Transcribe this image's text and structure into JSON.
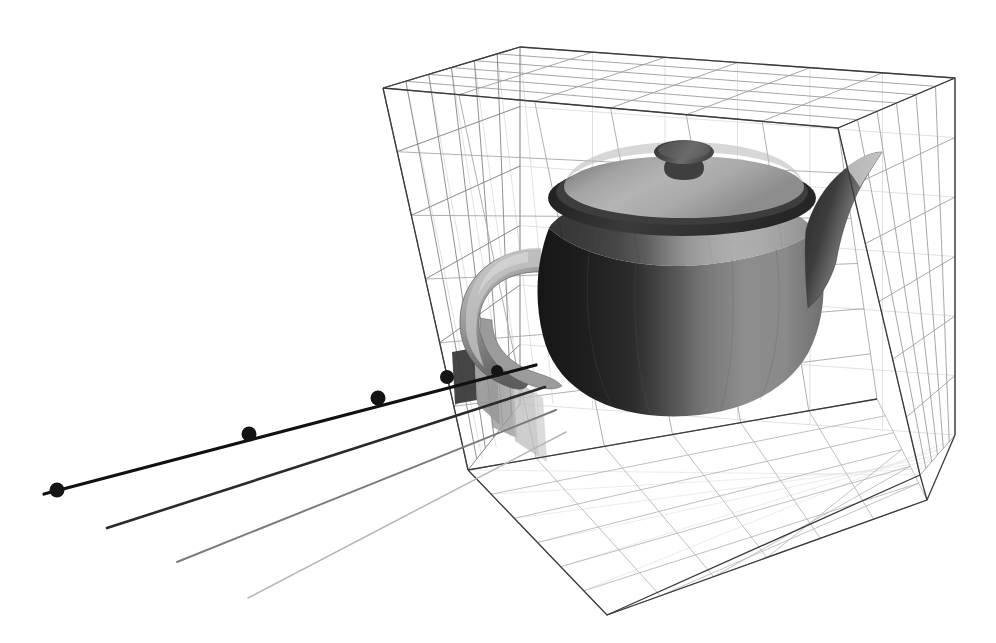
{
  "figure": {
    "title": "Ray traversal through a uniform voxel grid containing a Utah teapot",
    "caption": "",
    "background_color": "#ffffff",
    "width": 996,
    "height": 643
  },
  "palette": {
    "wire_edge": "#3a3a3a",
    "wire_grid_front": "#8e8e8e",
    "wire_grid_back": "#c8c8c8",
    "wire_grid_faint": "#dcdcdc",
    "ray_primary": "#111111",
    "ray_secondary": "#3d3d3d",
    "ray_tertiary": "#8a8a8a",
    "ray_quaternary": "#bdbdbd",
    "sample_dot": "#141414",
    "voxel_hit_dark": "#3b3b3b",
    "voxel_hit_mid": "#8f8f8f",
    "voxel_hit_light": "#b9b9b9",
    "teapot_dark": "#2b2b2b",
    "teapot_mid": "#6f6f6f",
    "teapot_light": "#a8a8a8",
    "teapot_highlight": "#d8d8d8"
  },
  "bounding_box": {
    "name": "voxel-grid-bounding-box",
    "subdivisions": [
      6,
      6,
      6
    ],
    "edge_color": "#3a3a3a",
    "grid_enabled": true,
    "corners_px": {
      "front_top_left": [
        383,
        88
      ],
      "front_top_right": [
        838,
        128
      ],
      "back_top_right": [
        955,
        78
      ],
      "back_top_left": [
        520,
        47
      ],
      "front_bottom_left": [
        468,
        470
      ],
      "front_bottom_mid": [
        607,
        615
      ],
      "front_bottom_right": [
        920,
        475
      ],
      "back_bottom_right": [
        955,
        435
      ]
    }
  },
  "teapot": {
    "name": "utah-teapot",
    "label": "Utah teapot",
    "shading": "flat-faceted-grayscale",
    "parts": [
      "body",
      "lid",
      "knob",
      "spout",
      "handle"
    ],
    "center_px": [
      690,
      300
    ]
  },
  "rays": [
    {
      "id": "ray-1",
      "label": "Primary ray 1",
      "color": "#111111",
      "width": 3.2,
      "origin_px": [
        44,
        494
      ],
      "end_px": [
        536,
        365
      ],
      "sample_points_px": [
        [
          57,
          490
        ],
        [
          249,
          434
        ],
        [
          378,
          398
        ],
        [
          447,
          377
        ],
        [
          497,
          371
        ]
      ]
    },
    {
      "id": "ray-2",
      "label": "Primary ray 2",
      "color": "#2a2a2a",
      "width": 2.6,
      "origin_px": [
        107,
        528
      ],
      "end_px": [
        545,
        387
      ],
      "sample_points_px": []
    },
    {
      "id": "ray-3",
      "label": "Primary ray 3",
      "color": "#7a7a7a",
      "width": 1.9,
      "origin_px": [
        177,
        562
      ],
      "end_px": [
        556,
        410
      ],
      "sample_points_px": []
    },
    {
      "id": "ray-4",
      "label": "Primary ray 4",
      "color": "#b5b5b5",
      "width": 1.5,
      "origin_px": [
        248,
        598
      ],
      "end_px": [
        566,
        432
      ],
      "sample_points_px": []
    }
  ],
  "traversed_voxels": [
    {
      "id": "voxel-hit-1",
      "shade": "#3b3b3b",
      "opacity": 0.95
    },
    {
      "id": "voxel-hit-2",
      "shade": "#8f8f8f",
      "opacity": 0.85
    },
    {
      "id": "voxel-hit-3",
      "shade": "#9a9a9a",
      "opacity": 0.8
    },
    {
      "id": "voxel-hit-4",
      "shade": "#bcbcbc",
      "opacity": 0.75
    }
  ],
  "chart_data": {
    "type": "scatter",
    "title": "Ray traversal through a uniform voxel grid containing a Utah teapot",
    "xlabel": "",
    "ylabel": "",
    "grid": true,
    "legend": false,
    "series": [
      {
        "name": "Primary ray 1 sample points",
        "values": [
          [
            57,
            490
          ],
          [
            249,
            434
          ],
          [
            378,
            398
          ],
          [
            447,
            377
          ],
          [
            497,
            371
          ]
        ]
      }
    ],
    "annotations": [
      "6x6x6 uniform voxel grid",
      "4 primary rays entering the grid",
      "Shaded cells mark voxels intersected by the ray"
    ]
  }
}
